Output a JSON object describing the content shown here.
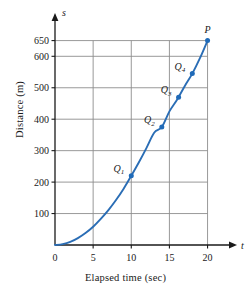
{
  "chart_data": {
    "type": "line",
    "title": "",
    "xlabel": "Elapsed time (sec)",
    "ylabel": "Distance (m)",
    "x_axis_symbol": "t",
    "y_axis_symbol": "s",
    "xlim": [
      0,
      21.5
    ],
    "ylim": [
      0,
      690
    ],
    "xticks": [
      0,
      5,
      10,
      15,
      20
    ],
    "xticklabels": [
      "0",
      "5",
      "10",
      "15",
      "20"
    ],
    "yticks": [
      100,
      200,
      300,
      400,
      500,
      600,
      650
    ],
    "yticklabels": [
      "100",
      "200",
      "300",
      "400",
      "500",
      "600",
      "650"
    ],
    "grid": true,
    "legend": null,
    "curve_color": "#2a6db5",
    "grid_color": "#8d8d8d",
    "marker_color": "#1f6ab8",
    "curve": {
      "name": "distance",
      "x": [
        0,
        1,
        2,
        3,
        4,
        5,
        6,
        7,
        8,
        9,
        10,
        11,
        12,
        13,
        14,
        15,
        16,
        17,
        18,
        19,
        20
      ],
      "y": [
        0,
        3,
        10,
        22,
        38,
        58,
        83,
        111,
        143,
        179,
        220,
        263,
        309,
        357,
        375,
        425,
        462,
        505,
        545,
        594,
        650
      ]
    },
    "points": [
      {
        "label": "Q",
        "subscript": "1",
        "x": 10,
        "y": 220,
        "label_pos": "left"
      },
      {
        "label": "Q",
        "subscript": "2",
        "x": 14,
        "y": 375,
        "label_pos": "left"
      },
      {
        "label": "Q",
        "subscript": "3",
        "x": 16.2,
        "y": 470,
        "label_pos": "left"
      },
      {
        "label": "Q",
        "subscript": "4",
        "x": 18,
        "y": 545,
        "label_pos": "left"
      },
      {
        "label": "P",
        "subscript": "",
        "x": 20,
        "y": 650,
        "label_pos": "above"
      }
    ]
  }
}
